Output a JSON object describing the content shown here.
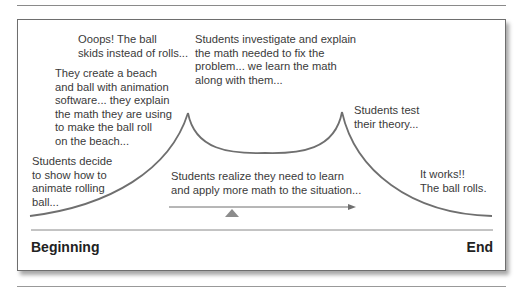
{
  "diagram": {
    "type": "process-curve",
    "stages": [
      {
        "id": "decide",
        "lines": [
          "Students decide",
          "to show how to",
          "animate rolling",
          "ball..."
        ]
      },
      {
        "id": "create",
        "lines": [
          "They create a beach",
          "and ball with animation",
          "software... they explain",
          "the math they are using",
          "to make the ball roll",
          "on the beach..."
        ]
      },
      {
        "id": "ooops",
        "lines": [
          "Ooops! The ball",
          "skids instead of rolls..."
        ]
      },
      {
        "id": "investigate",
        "lines": [
          "Students investigate and explain",
          "the math needed to fix the",
          "problem... we learn the math",
          "along with them..."
        ]
      },
      {
        "id": "test",
        "lines": [
          "Students test",
          "their theory..."
        ]
      },
      {
        "id": "works",
        "lines": [
          "It works!!",
          "The ball rolls."
        ]
      }
    ],
    "arrow_caption": [
      "Students realize they need to learn",
      "and apply more math to the situation..."
    ],
    "timeline": {
      "start_label": "Beginning",
      "end_label": "End"
    },
    "colors": {
      "curve": "#6f6f6f",
      "text": "#3a3a3a",
      "border": "#6e6e6e",
      "marker": "#8c8c8c"
    }
  }
}
